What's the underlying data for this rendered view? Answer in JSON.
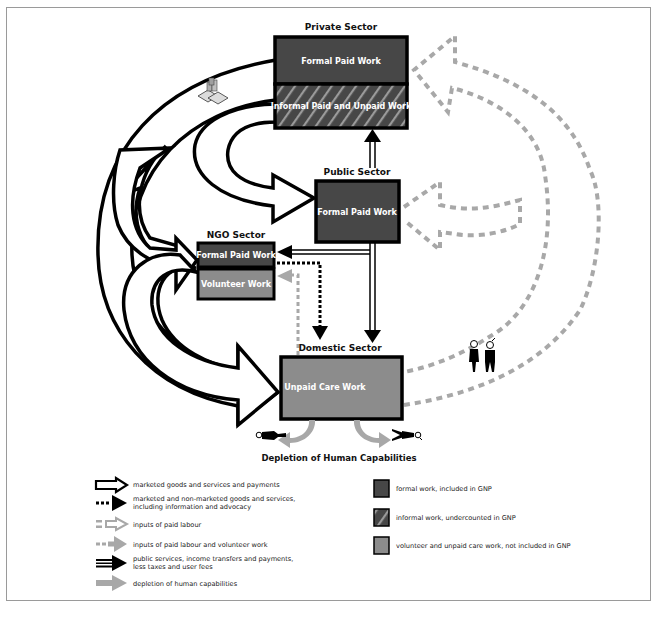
{
  "colors": {
    "formal": "#474747",
    "informal": "#474747",
    "informal_hatch": "#9a9a9a",
    "volunteer": "#8c8c8c",
    "outline": "#000000",
    "dashed_gray": "#a8a8a8",
    "frame": "#9a9a9a"
  },
  "sectors": {
    "private": {
      "title": "Private Sector",
      "boxes": [
        {
          "label": "Formal Paid Work",
          "type": "formal"
        },
        {
          "label": "Informal Paid and Unpaid Work",
          "type": "informal"
        }
      ]
    },
    "public": {
      "title": "Public Sector",
      "boxes": [
        {
          "label": "Formal Paid Work",
          "type": "formal"
        }
      ]
    },
    "ngo": {
      "title": "NGO Sector",
      "boxes": [
        {
          "label": "Formal Paid Work",
          "type": "formal"
        },
        {
          "label": "Volunteer Work",
          "type": "volunteer"
        }
      ]
    },
    "domestic": {
      "title": "Domestic Sector",
      "boxes": [
        {
          "label": "Unpaid Care Work",
          "type": "volunteer"
        }
      ]
    }
  },
  "depletion_title": "Depletion of Human Capabilities",
  "icons": {
    "money": "money-stack-icon",
    "couple": "woman-man-icon",
    "fallen_female": "fallen-woman-icon",
    "fallen_male": "fallen-man-icon"
  },
  "legend": {
    "arrows": [
      {
        "icon": "outline-arrow-icon",
        "label": "marketed goods and services and payments"
      },
      {
        "icon": "dotted-black-arrow-icon",
        "label_line1": "marketed and non-marketed goods and services,",
        "label_line2": "including information and advocacy"
      },
      {
        "icon": "dashed-gray-outline-arrow-icon",
        "label": "inputs of paid labour"
      },
      {
        "icon": "dashed-gray-solid-arrow-icon",
        "label": "inputs of paid labour and volunteer work"
      },
      {
        "icon": "double-line-black-arrow-icon",
        "label_line1": "public services, income transfers and payments,",
        "label_line2": "less taxes and user fees"
      },
      {
        "icon": "gray-solid-arrow-icon",
        "label": "depletion of human capabilities"
      }
    ],
    "swatches": [
      {
        "type": "formal",
        "label": "formal work, included in GNP"
      },
      {
        "type": "informal",
        "label": "informal work, undercounted in GNP"
      },
      {
        "type": "volunteer",
        "label": "volunteer and unpaid care work, not included in GNP"
      }
    ]
  }
}
